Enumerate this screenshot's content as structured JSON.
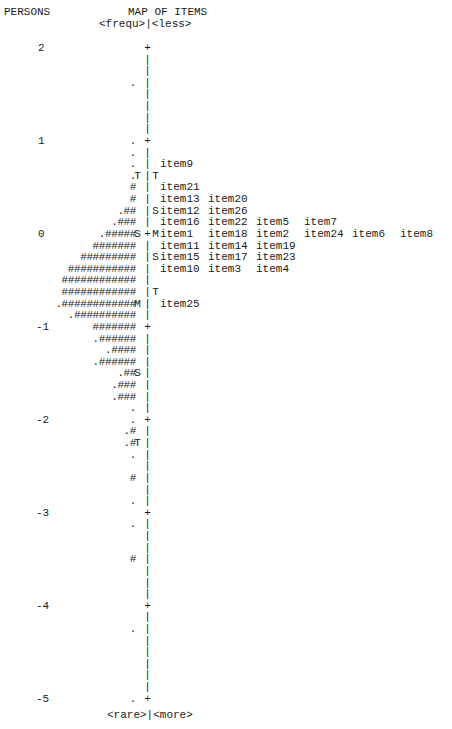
{
  "header": {
    "persons_label": "PERSONS",
    "map_title": "MAP OF ITEMS",
    "top_left_label": "<frequ>",
    "top_right_label": "<less>",
    "bottom_left_label": "<rare>",
    "bottom_right_label": "<more>"
  },
  "chart_data": {
    "type": "table",
    "title": "MAP OF ITEMS",
    "xlabel": "",
    "ylabel": "PERSONS",
    "ylim": [
      -5,
      2
    ],
    "scale_ticks": [
      2,
      1,
      0,
      -1,
      -2,
      -3,
      -4,
      -5
    ],
    "lines_per_unit": 8,
    "rows": [
      {
        "scale": "2",
        "persons": "",
        "lmark": "",
        "axis": "+",
        "rmark": "",
        "items": []
      },
      {
        "scale": "",
        "persons": "",
        "lmark": "",
        "axis": "|",
        "rmark": "",
        "items": []
      },
      {
        "scale": "",
        "persons": "",
        "lmark": "",
        "axis": "|",
        "rmark": "",
        "items": []
      },
      {
        "scale": "",
        "persons": ".",
        "lmark": "",
        "axis": "|",
        "rmark": "",
        "items": []
      },
      {
        "scale": "",
        "persons": "",
        "lmark": "",
        "axis": "|",
        "rmark": "",
        "items": []
      },
      {
        "scale": "",
        "persons": "",
        "lmark": "",
        "axis": "|",
        "rmark": "",
        "items": []
      },
      {
        "scale": "",
        "persons": "",
        "lmark": "",
        "axis": "|",
        "rmark": "",
        "items": []
      },
      {
        "scale": "",
        "persons": "",
        "lmark": "",
        "axis": "|",
        "rmark": "",
        "items": []
      },
      {
        "scale": "1",
        "persons": ".",
        "lmark": "",
        "axis": "+",
        "rmark": "",
        "items": []
      },
      {
        "scale": "",
        "persons": ".",
        "lmark": "",
        "axis": "|",
        "rmark": "",
        "items": []
      },
      {
        "scale": "",
        "persons": ".",
        "lmark": "",
        "axis": "|",
        "rmark": "",
        "items": [
          "item9"
        ]
      },
      {
        "scale": "",
        "persons": ".",
        "lmark": "T",
        "axis": "|",
        "rmark": "T",
        "items": []
      },
      {
        "scale": "",
        "persons": "#",
        "lmark": "",
        "axis": "|",
        "rmark": "",
        "items": [
          "item21"
        ]
      },
      {
        "scale": "",
        "persons": "#",
        "lmark": "",
        "axis": "|",
        "rmark": "",
        "items": [
          "item13",
          "item20"
        ]
      },
      {
        "scale": "",
        "persons": ".##",
        "lmark": "",
        "axis": "|",
        "rmark": "S",
        "items": [
          "item12",
          "item26"
        ]
      },
      {
        "scale": "",
        "persons": ".###",
        "lmark": "",
        "axis": "|",
        "rmark": "",
        "items": [
          "item16",
          "item22",
          "item5",
          "item7"
        ]
      },
      {
        "scale": "0",
        "persons": ".#####",
        "lmark": "S",
        "axis": "+",
        "rmark": "M",
        "items": [
          "item1",
          "item18",
          "item2",
          "item24",
          "item6",
          "item8"
        ]
      },
      {
        "scale": "",
        "persons": "#######",
        "lmark": "",
        "axis": "|",
        "rmark": "",
        "items": [
          "item11",
          "item14",
          "item19"
        ]
      },
      {
        "scale": "",
        "persons": "#########",
        "lmark": "",
        "axis": "|",
        "rmark": "S",
        "items": [
          "item15",
          "item17",
          "item23"
        ]
      },
      {
        "scale": "",
        "persons": "###########",
        "lmark": "",
        "axis": "|",
        "rmark": "",
        "items": [
          "item10",
          "item3",
          "item4"
        ]
      },
      {
        "scale": "",
        "persons": "############",
        "lmark": "",
        "axis": "|",
        "rmark": "",
        "items": []
      },
      {
        "scale": "",
        "persons": "############",
        "lmark": "",
        "axis": "|",
        "rmark": "T",
        "items": []
      },
      {
        "scale": "",
        "persons": ".############",
        "lmark": "M",
        "axis": "|",
        "rmark": "",
        "items": [
          "item25"
        ]
      },
      {
        "scale": "",
        "persons": ".##########",
        "lmark": "",
        "axis": "|",
        "rmark": "",
        "items": []
      },
      {
        "scale": "-1",
        "persons": "#######",
        "lmark": "",
        "axis": "+",
        "rmark": "",
        "items": []
      },
      {
        "scale": "",
        "persons": ".######",
        "lmark": "",
        "axis": "|",
        "rmark": "",
        "items": []
      },
      {
        "scale": "",
        "persons": ".####",
        "lmark": "",
        "axis": "|",
        "rmark": "",
        "items": []
      },
      {
        "scale": "",
        "persons": ".######",
        "lmark": "",
        "axis": "|",
        "rmark": "",
        "items": []
      },
      {
        "scale": "",
        "persons": ".##",
        "lmark": "S",
        "axis": "|",
        "rmark": "",
        "items": []
      },
      {
        "scale": "",
        "persons": ".###",
        "lmark": "",
        "axis": "|",
        "rmark": "",
        "items": []
      },
      {
        "scale": "",
        "persons": ".###",
        "lmark": "",
        "axis": "|",
        "rmark": "",
        "items": []
      },
      {
        "scale": "",
        "persons": ".",
        "lmark": "",
        "axis": "|",
        "rmark": "",
        "items": []
      },
      {
        "scale": "-2",
        "persons": ".",
        "lmark": "",
        "axis": "+",
        "rmark": "",
        "items": []
      },
      {
        "scale": "",
        "persons": ".#",
        "lmark": "",
        "axis": "|",
        "rmark": "",
        "items": []
      },
      {
        "scale": "",
        "persons": ".#",
        "lmark": "T",
        "axis": "|",
        "rmark": "",
        "items": []
      },
      {
        "scale": "",
        "persons": ".",
        "lmark": "",
        "axis": "|",
        "rmark": "",
        "items": []
      },
      {
        "scale": "",
        "persons": "",
        "lmark": "",
        "axis": "|",
        "rmark": "",
        "items": []
      },
      {
        "scale": "",
        "persons": "#",
        "lmark": "",
        "axis": "|",
        "rmark": "",
        "items": []
      },
      {
        "scale": "",
        "persons": "",
        "lmark": "",
        "axis": "|",
        "rmark": "",
        "items": []
      },
      {
        "scale": "",
        "persons": ".",
        "lmark": "",
        "axis": "|",
        "rmark": "",
        "items": []
      },
      {
        "scale": "-3",
        "persons": "",
        "lmark": "",
        "axis": "+",
        "rmark": "",
        "items": []
      },
      {
        "scale": "",
        "persons": ".",
        "lmark": "",
        "axis": "|",
        "rmark": "",
        "items": []
      },
      {
        "scale": "",
        "persons": "",
        "lmark": "",
        "axis": "|",
        "rmark": "",
        "items": []
      },
      {
        "scale": "",
        "persons": "",
        "lmark": "",
        "axis": "|",
        "rmark": "",
        "items": []
      },
      {
        "scale": "",
        "persons": "#",
        "lmark": "",
        "axis": "|",
        "rmark": "",
        "items": []
      },
      {
        "scale": "",
        "persons": "",
        "lmark": "",
        "axis": "|",
        "rmark": "",
        "items": []
      },
      {
        "scale": "",
        "persons": "",
        "lmark": "",
        "axis": "|",
        "rmark": "",
        "items": []
      },
      {
        "scale": "",
        "persons": "",
        "lmark": "",
        "axis": "|",
        "rmark": "",
        "items": []
      },
      {
        "scale": "-4",
        "persons": "",
        "lmark": "",
        "axis": "+",
        "rmark": "",
        "items": []
      },
      {
        "scale": "",
        "persons": "",
        "lmark": "",
        "axis": "|",
        "rmark": "",
        "items": []
      },
      {
        "scale": "",
        "persons": ".",
        "lmark": "",
        "axis": "|",
        "rmark": "",
        "items": []
      },
      {
        "scale": "",
        "persons": "",
        "lmark": "",
        "axis": "|",
        "rmark": "",
        "items": []
      },
      {
        "scale": "",
        "persons": "",
        "lmark": "",
        "axis": "|",
        "rmark": "",
        "items": []
      },
      {
        "scale": "",
        "persons": "",
        "lmark": "",
        "axis": "|",
        "rmark": "",
        "items": []
      },
      {
        "scale": "",
        "persons": "",
        "lmark": "",
        "axis": "|",
        "rmark": "",
        "items": []
      },
      {
        "scale": "",
        "persons": "",
        "lmark": "",
        "axis": "|",
        "rmark": "",
        "items": []
      },
      {
        "scale": "-5",
        "persons": ".",
        "lmark": "",
        "axis": "+",
        "rmark": "",
        "items": []
      }
    ],
    "legend": {
      "#": "persons (multiple)",
      ".": "persons (few)",
      "M": "mean",
      "S": "one standard deviation",
      "T": "two standard deviations"
    }
  }
}
